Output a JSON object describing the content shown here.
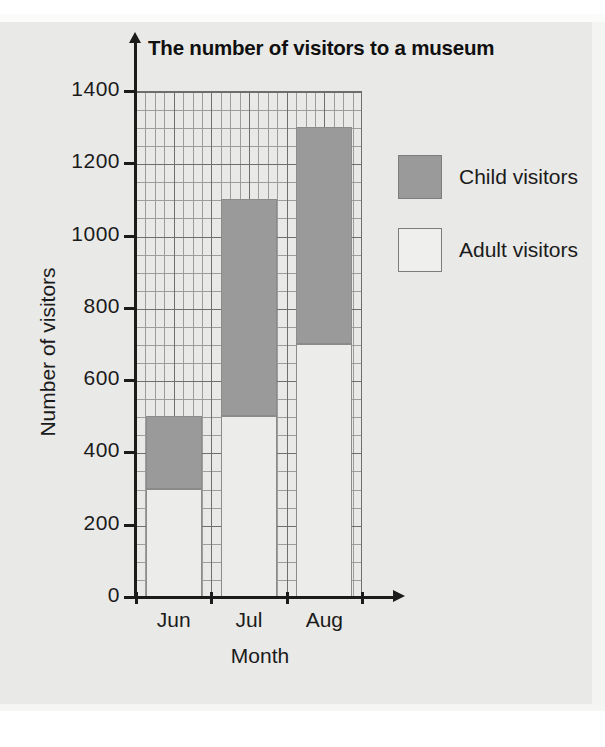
{
  "chart_data": {
    "type": "bar",
    "subtype": "stacked-bar",
    "title": "The number of visitors to a museum",
    "xlabel": "Month",
    "ylabel": "Number of visitors",
    "categories": [
      "Jun",
      "Jul",
      "Aug"
    ],
    "series": [
      {
        "name": "Adult visitors",
        "values": [
          300,
          500,
          700
        ],
        "color": "#ececea"
      },
      {
        "name": "Child visitors",
        "values": [
          200,
          600,
          600
        ],
        "color": "#9a9a9a"
      }
    ],
    "totals": [
      500,
      1100,
      1300
    ],
    "ylim": [
      0,
      1400
    ],
    "ytick_labels": [
      "0",
      "200",
      "400",
      "600",
      "800",
      "1000",
      "1200",
      "1400"
    ],
    "ytick_values": [
      0,
      200,
      400,
      600,
      800,
      1000,
      1200,
      1400
    ],
    "y_major_step": 200,
    "y_minor_step": 50,
    "grid": true,
    "legend_position": "right",
    "legend_entries": [
      {
        "label": "Child visitors",
        "swatch": "#9a9a9a"
      },
      {
        "label": "Adult visitors",
        "swatch": "#efefed"
      }
    ]
  },
  "colors": {
    "paper": "#e9e9e7",
    "axis": "#1b1b1b",
    "grid_major": "#6e6e6e",
    "grid_minor": "#9d9d9d",
    "child": "#9a9a9a",
    "adult": "#ececea"
  }
}
